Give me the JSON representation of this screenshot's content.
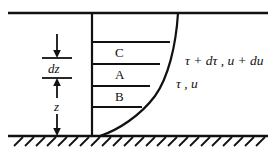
{
  "figure": {
    "type": "boundary-layer-velocity-profile-diagram",
    "background_color": "#ffffff",
    "line_color": "#111111"
  },
  "layers": [
    {
      "id": "C",
      "label": "C"
    },
    {
      "id": "A",
      "label": "A"
    },
    {
      "id": "B",
      "label": "B"
    }
  ],
  "dimensions": {
    "dz_label": "dz",
    "z_label": "z"
  },
  "annotations": {
    "upper": "τ + dτ ,  u + du",
    "lower": "τ ,  u"
  },
  "geometry": {
    "top_plate_y": 13,
    "ground_y": 136,
    "wall_x": 92,
    "curve_top_x": 178,
    "profile_line_ys": [
      42,
      64,
      86,
      107
    ],
    "profile_line_end_xs": [
      170,
      160,
      150,
      142
    ],
    "dim_tick_ys": [
      58,
      78
    ],
    "dim_tick_x1": 42,
    "dim_tick_x2": 72,
    "hatch_count": 23,
    "hatch_spacing": 11,
    "hatch_length": 10
  }
}
